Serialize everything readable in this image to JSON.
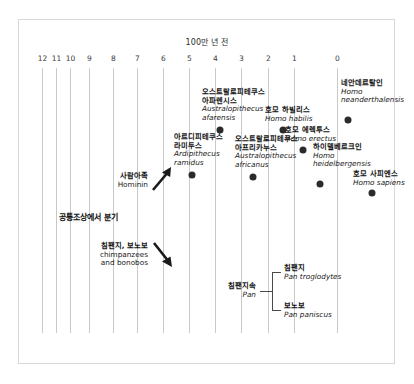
{
  "chart_data": {
    "type": "scatter",
    "title": "100만 년 전",
    "xlabel": "",
    "ylabel": "",
    "xlim": [
      12,
      0
    ],
    "grid": true,
    "legend": "none",
    "tick_labels": [
      "12",
      "11",
      "10",
      "9",
      "8",
      "7",
      "6",
      "5",
      "4",
      "3",
      "2",
      "1",
      "0"
    ],
    "tick_x_px": [
      42,
      56,
      70,
      89,
      113,
      137,
      163,
      189,
      215,
      241,
      268,
      294,
      337
    ],
    "categories": [
      "Australopithecus afarensis",
      "Homo habilis",
      "Homo neanderthalensis",
      "Ardipithecus ramidus",
      "Australopithecus africanus",
      "Homo erectus",
      "Homo heidelbergensis",
      "Homo sapiens"
    ],
    "values": [
      3.6,
      2.2,
      0.3,
      4.4,
      2.8,
      1.6,
      0.6,
      0.2
    ],
    "points": [
      {
        "ko": "오스트랄로피테쿠스",
        "ko2": "아파렌시스",
        "sci": "Australopithecus",
        "sci2": "afarensis",
        "mya": 3.6,
        "dot_x": 220,
        "dot_y": 130
      },
      {
        "ko": "호모 하빌리스",
        "ko2": "",
        "sci": "Homo habilis",
        "sci2": "",
        "mya": 2.2,
        "dot_x": 283,
        "dot_y": 130
      },
      {
        "ko": "네안데르탈인",
        "ko2": "",
        "sci": "Homo",
        "sci2": "neanderthalensis",
        "mya": 0.3,
        "dot_x": 348,
        "dot_y": 120
      },
      {
        "ko": "아르디피테쿠스",
        "ko2": "라미두스",
        "sci": "Ardipithecus",
        "sci2": "ramidus",
        "mya": 4.4,
        "dot_x": 192,
        "dot_y": 175
      },
      {
        "ko": "오스트랄로피테쿠스",
        "ko2": "아프리카누스",
        "sci": "Australopithecus",
        "sci2": "africanus",
        "mya": 2.8,
        "dot_x": 253,
        "dot_y": 177
      },
      {
        "ko": "호모 에렉투스",
        "ko2": "",
        "sci": "Homo erectus",
        "sci2": "",
        "mya": 1.6,
        "dot_x": 303,
        "dot_y": 150
      },
      {
        "ko": "하이델베르크인",
        "ko2": "",
        "sci": "Homo",
        "sci2": "heidelbergensis",
        "mya": 0.6,
        "dot_x": 320,
        "dot_y": 184
      },
      {
        "ko": "호모 사피엔스",
        "ko2": "",
        "sci": "Homo sapiens",
        "sci2": "",
        "mya": 0.2,
        "dot_x": 372,
        "dot_y": 193
      }
    ],
    "annotations": [
      {
        "ko": "사람아족",
        "en": "Hominin",
        "arrow": "up-right"
      },
      {
        "ko": "공통조상에서 분기",
        "en": "",
        "arrow": "none"
      },
      {
        "ko": "침팬지, 보노보",
        "en": "chimpanzees and bonobos",
        "arrow": "down-right"
      }
    ],
    "clade": {
      "parent_ko": "침팬지속",
      "parent_sci": "Pan",
      "children": [
        {
          "ko": "침팬지",
          "sci": "Pan troglodytes"
        },
        {
          "ko": "보노보",
          "sci": "Pan paniscus"
        }
      ]
    }
  },
  "chart": {
    "title": "100만 년 전",
    "ticks": [
      "12",
      "11",
      "10",
      "9",
      "8",
      "7",
      "6",
      "5",
      "4",
      "3",
      "2",
      "1",
      "0"
    ],
    "species": [
      {
        "ko_line1": "오스트랄로피테쿠스",
        "ko_line2": "아파렌시스",
        "sci_line1": "Australopithecus",
        "sci_line2": "afarensis"
      },
      {
        "ko_line1": "호모 하빌리스",
        "ko_line2": "",
        "sci_line1": "Homo habilis",
        "sci_line2": ""
      },
      {
        "ko_line1": "네안데르탈인",
        "ko_line2": "",
        "sci_line1": "Homo",
        "sci_line2": "neanderthalensis"
      },
      {
        "ko_line1": "아르디피테쿠스",
        "ko_line2": "라미두스",
        "sci_line1": "Ardipithecus",
        "sci_line2": "ramidus"
      },
      {
        "ko_line1": "오스트랄로피테쿠스",
        "ko_line2": "아프리카누스",
        "sci_line1": "Australopithecus",
        "sci_line2": "africanus"
      },
      {
        "ko_line1": "호모 에렉투스",
        "ko_line2": "",
        "sci_line1": "Homo erectus",
        "sci_line2": ""
      },
      {
        "ko_line1": "하이델베르크인",
        "ko_line2": "",
        "sci_line1": "Homo",
        "sci_line2": "heidelbergensis"
      },
      {
        "ko_line1": "호모 사피엔스",
        "ko_line2": "",
        "sci_line1": "Homo sapiens",
        "sci_line2": ""
      }
    ],
    "annotations": {
      "hominin_ko": "사람아족",
      "hominin_en": "Hominin",
      "divergence": "공통조상에서 분기",
      "pan_ko": "침팬지, 보노보",
      "pan_en_line1": "chimpanzees",
      "pan_en_line2": "and bonobos"
    },
    "clade": {
      "parent_ko": "침팬지속",
      "parent_sci": "Pan",
      "child1_ko": "침팬지",
      "child1_sci": "Pan troglodytes",
      "child2_ko": "보노보",
      "child2_sci": "Pan paniscus"
    }
  },
  "colors": {
    "dot": "#2b2b2b",
    "grid": "#c9c9c9",
    "frame": "#d8d8d8",
    "text": "#1a1a1a"
  }
}
